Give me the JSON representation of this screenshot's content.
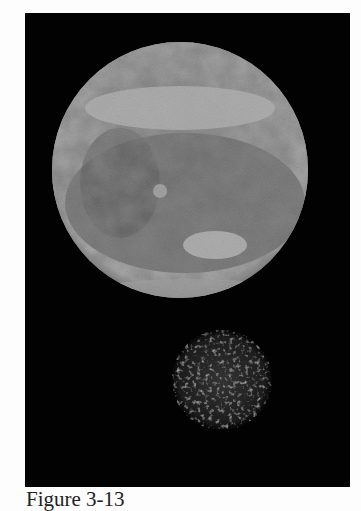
{
  "figure": {
    "caption": "Figure 3-13",
    "panel_background": "#020202",
    "large_body": {
      "label": "large planetary disk",
      "cx": 155,
      "cy": 157,
      "r": 128
    },
    "small_body": {
      "label": "small mottled moon",
      "cx": 197,
      "cy": 367,
      "r": 50
    }
  }
}
